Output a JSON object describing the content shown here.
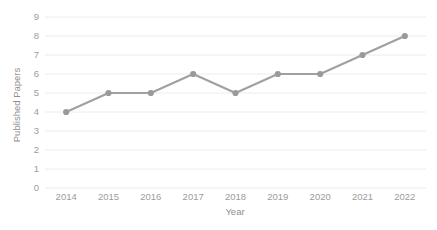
{
  "chart_data": {
    "type": "line",
    "title": "",
    "xlabel": "Year",
    "ylabel": "Published Papers",
    "categories": [
      "2014",
      "2015",
      "2016",
      "2017",
      "2018",
      "2019",
      "2020",
      "2021",
      "2022"
    ],
    "values": [
      4,
      5,
      5,
      6,
      5,
      6,
      6,
      7,
      8
    ],
    "series": [
      {
        "name": "Published Papers",
        "values": [
          4,
          5,
          5,
          6,
          5,
          6,
          6,
          7,
          8
        ]
      }
    ],
    "ylim": [
      0,
      9
    ],
    "yticks": [
      "0",
      "1",
      "2",
      "3",
      "4",
      "5",
      "6",
      "7",
      "8",
      "9"
    ],
    "xticks": [
      "2014",
      "2015",
      "2016",
      "2017",
      "2018",
      "2019",
      "2020",
      "2021",
      "2022"
    ],
    "grid": true,
    "grid_axis": "y",
    "legend": false,
    "legend_position": "none",
    "markers": true,
    "colors": {
      "line": "#a0a0a0",
      "marker": "#9a9a9a",
      "grid": "#ececec",
      "tick_label": "#9c9c9c",
      "axis_title": "#8f8f8f",
      "background": "#ffffff"
    }
  }
}
